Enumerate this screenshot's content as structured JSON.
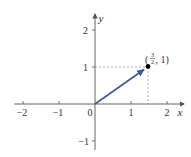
{
  "diagram": {
    "type": "vector-plot",
    "axes": {
      "x_label": "x",
      "y_label": "y",
      "x_ticks": [
        {
          "value": -2,
          "label": "−2"
        },
        {
          "value": -1,
          "label": "−1"
        },
        {
          "value": 0,
          "label": "0"
        },
        {
          "value": 1,
          "label": "1"
        },
        {
          "value": 2,
          "label": "2"
        }
      ],
      "y_ticks": [
        {
          "value": 2,
          "label": "2"
        },
        {
          "value": 1,
          "label": "1"
        },
        {
          "value": -1,
          "label": "−1"
        }
      ]
    },
    "vector": {
      "from": [
        0,
        0
      ],
      "to": [
        1.5,
        1
      ],
      "color": "#3b5a9a"
    },
    "point": {
      "x": 1.5,
      "y": 1,
      "label_open": "(",
      "label_num": "3",
      "label_den": "2",
      "label_rest": ", 1)",
      "color": "#000000"
    },
    "guide_lines": "dashed",
    "colors": {
      "axis": "#555555",
      "guide": "#888888",
      "vector": "#3b5a9a"
    }
  }
}
